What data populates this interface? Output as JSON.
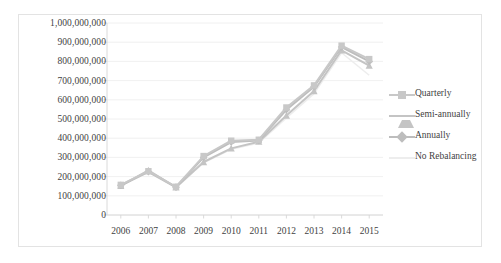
{
  "chart_data": {
    "type": "line",
    "title": "",
    "xlabel": "",
    "ylabel": "",
    "categories": [
      "2006",
      "2007",
      "2008",
      "2009",
      "2010",
      "2011",
      "2012",
      "2013",
      "2014",
      "2015"
    ],
    "ylim": [
      0,
      1000000000
    ],
    "ytick_values": [
      0,
      100000000,
      200000000,
      300000000,
      400000000,
      500000000,
      600000000,
      700000000,
      800000000,
      900000000,
      1000000000
    ],
    "ytick_labels": [
      "0",
      "100,000,000",
      "200,000,000",
      "300,000,000",
      "400,000,000",
      "500,000,000",
      "600,000,000",
      "700,000,000",
      "800,000,000",
      "900,000,000",
      "1,000,000,000"
    ],
    "grid": "horizontal",
    "legend_position": "right",
    "series": [
      {
        "name": "Quarterly",
        "marker": "square",
        "color": "#c8c8c8",
        "values": [
          157000000,
          228000000,
          147000000,
          307000000,
          387000000,
          392000000,
          560000000,
          675000000,
          882000000,
          812000000
        ]
      },
      {
        "name": "Semi-annually",
        "marker": "triangle",
        "color": "#c4c4c4",
        "values": [
          152000000,
          232000000,
          144000000,
          276000000,
          347000000,
          382000000,
          518000000,
          646000000,
          858000000,
          778000000
        ]
      },
      {
        "name": "Annually",
        "marker": "diamond",
        "color": "#bdbdbd",
        "values": [
          155000000,
          225000000,
          145000000,
          300000000,
          380000000,
          388000000,
          548000000,
          668000000,
          875000000,
          800000000
        ]
      },
      {
        "name": "No Rebalancing",
        "marker": "none",
        "color": "#ededed",
        "values": [
          150000000,
          222000000,
          142000000,
          272000000,
          342000000,
          375000000,
          505000000,
          632000000,
          845000000,
          728000000
        ]
      }
    ]
  },
  "legend": {
    "items": [
      {
        "label": "Quarterly"
      },
      {
        "label": "Semi-annually"
      },
      {
        "label": "Annually"
      },
      {
        "label": "No Rebalancing"
      }
    ]
  }
}
